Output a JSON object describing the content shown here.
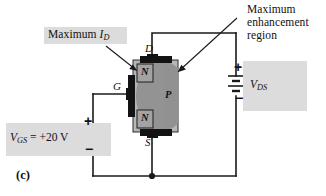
{
  "figure": {
    "panel_id": "(c)",
    "background_color": "#ffffff",
    "highlight_color": "#dcdcdc",
    "wire_color": "#1a1a1a",
    "substrate_color": "#b0b0b0",
    "channel_color": "#8c8c8c",
    "n_region_color": "#9a9a9a",
    "contact_color": "#141414"
  },
  "callouts": {
    "max_id": {
      "label": "Maximum",
      "symbol": "I",
      "symbol_sub": "D",
      "target": "upper-n-region"
    },
    "max_enhancement": {
      "line1": "Maximum",
      "line2": "enhancement",
      "line3": "region",
      "target": "p-channel-region"
    }
  },
  "device": {
    "terminals": {
      "drain": "D",
      "gate": "G",
      "source": "S"
    },
    "regions": {
      "upper_n": "N",
      "lower_n": "N",
      "channel_p": "P"
    }
  },
  "sources": {
    "gate_supply": {
      "symbol": "V",
      "symbol_sub": "GS",
      "equals": "=",
      "value": "+20 V",
      "full_label": "V_GS = +20 V",
      "type": "variable-dc-source",
      "plus": "+",
      "minus": "−"
    },
    "drain_supply": {
      "symbol": "V",
      "symbol_sub": "DS",
      "full_label": "V_DS",
      "type": "dc-battery",
      "plus": "+",
      "minus": "−"
    }
  }
}
